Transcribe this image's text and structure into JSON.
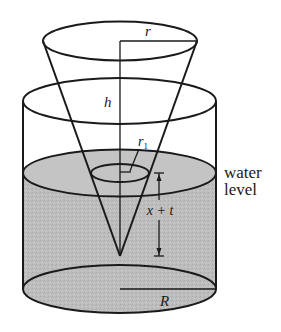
{
  "figure": {
    "labels": {
      "cone_radius": "r",
      "cone_height": "h",
      "waterline_radius": "r",
      "waterline_radius_sub": "1",
      "depth": "x + t",
      "water_level_line1": "water",
      "water_level_line2": "level",
      "tank_radius": "R"
    },
    "colors": {
      "stroke": "#1a1a1a",
      "water_fill": "#b9b9b9",
      "background": "#ffffff"
    }
  }
}
